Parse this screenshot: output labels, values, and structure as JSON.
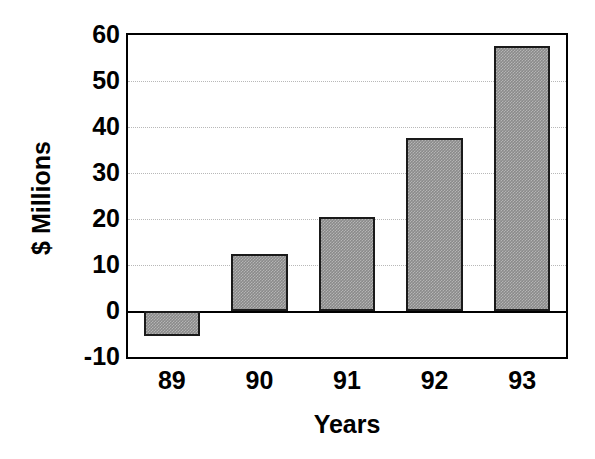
{
  "chart_data": {
    "type": "bar",
    "title": "",
    "xlabel": "Years",
    "ylabel": "$ Millions",
    "categories": [
      "89",
      "90",
      "91",
      "92",
      "93"
    ],
    "values": [
      -5.5,
      12.5,
      20.4,
      37.6,
      57.6
    ],
    "series": [
      {
        "name": "$ Millions",
        "values": [
          -5.5,
          12.5,
          20.4,
          37.6,
          57.6
        ]
      }
    ],
    "ylim": [
      -10,
      60
    ],
    "yticks": [
      60,
      50,
      40,
      30,
      20,
      10,
      0,
      -10
    ],
    "ytick_labels": [
      "60",
      "50",
      "40",
      "30",
      "20",
      "10",
      "0",
      "-10"
    ],
    "xtick_labels": [
      "89",
      "90",
      "91",
      "92",
      "93"
    ],
    "grid": true,
    "grid_axis": "y",
    "grid_style": "dotted",
    "legend": false,
    "legend_position": "none",
    "bar_fill_color": "#8a8a8a",
    "bar_edge_color": "#1a1a1a",
    "background_color": "#ffffff",
    "axis_color": "#000000",
    "gridline_color": "#b8b8b8",
    "zero_line_value": 0,
    "annotations": []
  }
}
